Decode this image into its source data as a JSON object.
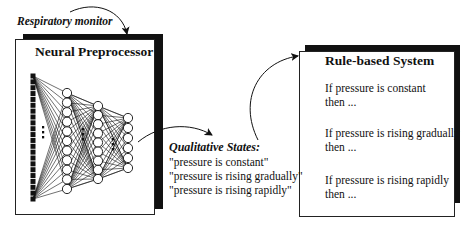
{
  "input_label": "Respiratory monitor",
  "neural_box": {
    "title": "Neural Preprocessor",
    "layers": [
      {
        "type": "input",
        "count": 22
      },
      {
        "type": "hidden",
        "count": 11
      },
      {
        "type": "hidden",
        "count": 9
      },
      {
        "type": "output",
        "count": 6
      }
    ]
  },
  "states": {
    "heading": "Qualitative States:",
    "items": [
      "\"pressure is constant\"",
      "\"pressure is rising gradually\"",
      "\"pressure is rising rapidly\""
    ]
  },
  "rule_box": {
    "title": "Rule-based System",
    "rules": [
      {
        "if": "If pressure is constant",
        "then": "then ..."
      },
      {
        "if": "If pressure is rising gradually",
        "then": "then ..."
      },
      {
        "if": "If pressure is rising rapidly",
        "then": "then ..."
      }
    ]
  },
  "colors": {
    "ink": "#111111",
    "background": "#ffffff"
  }
}
